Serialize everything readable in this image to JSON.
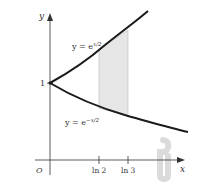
{
  "figure": {
    "axis_labels": {
      "x": "x",
      "y": "y",
      "origin": "O"
    },
    "y_tick_label": "1",
    "x_tick_labels": [
      "ln 2",
      "ln 3"
    ],
    "curves": [
      {
        "name": "upper",
        "equation_prefix": "y = e",
        "exponent": "x/2"
      },
      {
        "name": "lower",
        "equation_prefix": "y = e",
        "exponent": "−x/2"
      }
    ],
    "shaded_region": {
      "from": "ln 2",
      "to": "ln 3",
      "color": "#e6e6e6"
    },
    "colors": {
      "curve": "#1a1a1a",
      "axis": "#333333",
      "shade": "#e6e6e6",
      "rotate_icon": "#d4d4d4"
    },
    "rotation_icon": "rotate-arrow-icon"
  }
}
